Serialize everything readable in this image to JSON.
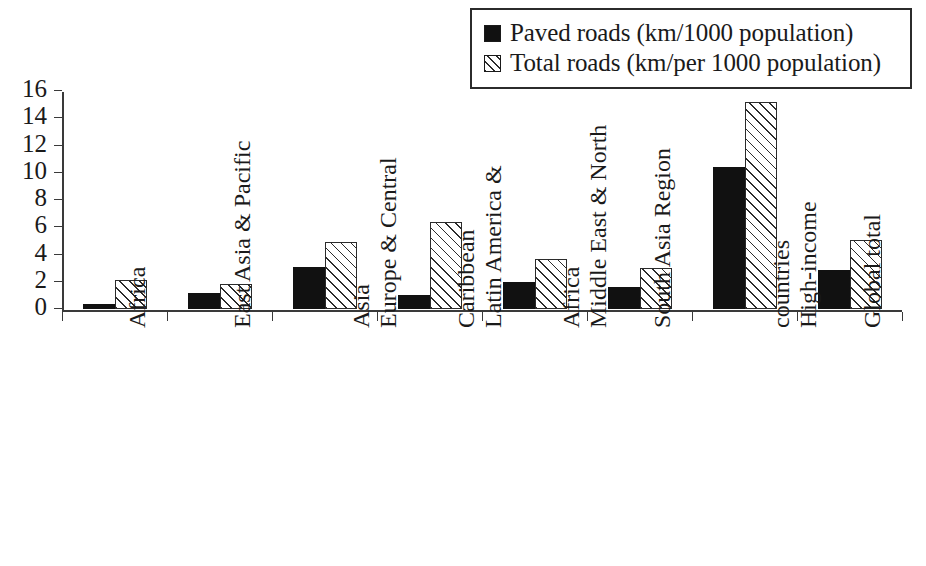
{
  "chart_data": {
    "type": "bar",
    "title": "",
    "subtitle": "",
    "xlabel": "",
    "ylabel": "",
    "ylim": [
      0,
      16
    ],
    "yticks": [
      0,
      2,
      4,
      6,
      8,
      10,
      12,
      14,
      16
    ],
    "ytick_labels": [
      "0",
      "2",
      "4",
      "6",
      "8",
      "10",
      "12",
      "14",
      "16"
    ],
    "grid": false,
    "legend_position": "top-right",
    "categories": [
      "Africa",
      "East Asia & Pacific",
      "Europe & Central Asia",
      "Latin America & Caribbean",
      "Middle East & North Africa",
      "South Asia Region",
      "High-income countries",
      "Global total"
    ],
    "category_lines": [
      [
        "Africa"
      ],
      [
        "East Asia & Pacific"
      ],
      [
        "Europe & Central",
        "Asia"
      ],
      [
        "Latin America &",
        "Caribbean"
      ],
      [
        "Middle East & North",
        "Africa"
      ],
      [
        "South Asia Region"
      ],
      [
        "High-income",
        "countries"
      ],
      [
        "Global total"
      ]
    ],
    "series": [
      {
        "name": "Paved roads (km/1000 population)",
        "key": "paved",
        "fill": "solid-black",
        "color": "#111111",
        "values": [
          0.4,
          1.2,
          3.1,
          1.0,
          2.0,
          1.6,
          10.4,
          2.9
        ]
      },
      {
        "name": "Total roads (km/per 1000 population)",
        "key": "total",
        "fill": "diagonal-hatch",
        "color": "#2b2b2b",
        "values": [
          2.1,
          1.8,
          4.9,
          6.4,
          3.7,
          3.0,
          15.2,
          5.1
        ]
      }
    ]
  },
  "legend": {
    "items": [
      {
        "label": "Paved roads (km/1000 population)",
        "swatch": "solid-black-swatch"
      },
      {
        "label": "Total roads (km/per 1000 population)",
        "swatch": "hatched-swatch"
      }
    ]
  }
}
